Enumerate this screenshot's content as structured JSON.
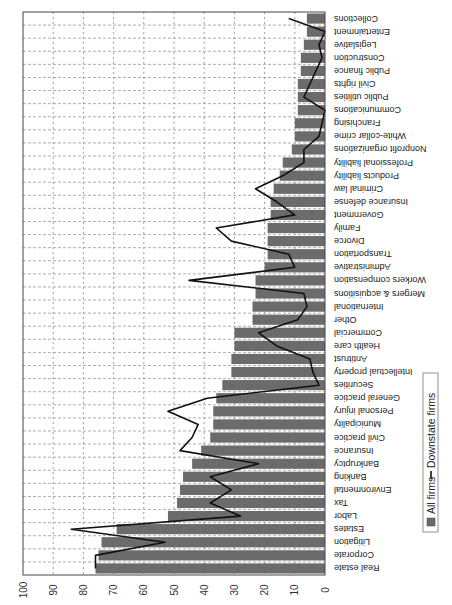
{
  "chart_data": {
    "type": "bar",
    "orientation_note": "Figure is rendered rotated: value axis runs right-to-left along the bottom, categories run top-to-bottom with upside-down labels.",
    "title": "",
    "xlabel": "",
    "ylabel": "",
    "ylim": [
      0,
      100
    ],
    "ticks": [
      0,
      10,
      20,
      30,
      40,
      50,
      60,
      70,
      80,
      90,
      100
    ],
    "grid": true,
    "legend_position": "right (rotated)",
    "categories": [
      "Real estate",
      "Corporate",
      "Litigation",
      "Estates",
      "Labor",
      "Tax",
      "Environmental",
      "Banking",
      "Bankruptcy",
      "Insurance",
      "Civil practice",
      "Municipality",
      "Personal injury",
      "General practice",
      "Securities",
      "Intellectual property",
      "Antitrust",
      "Health care",
      "Commercial",
      "Other",
      "International",
      "Mergers & acquisitions",
      "Workers compensation",
      "Administrative",
      "Transportation",
      "Divorce",
      "Family",
      "Government",
      "Insurance defense",
      "Criminal law",
      "Products liability",
      "Professional liability",
      "Nonprofit organizations",
      "White-collar crime",
      "Franchising",
      "Communications",
      "Public utilities",
      "Civil rights",
      "Public finance",
      "Construction",
      "Legislative",
      "Entertainment",
      "Collections"
    ],
    "series": [
      {
        "name": "All firms",
        "type": "bar",
        "color": "#6b6b6b",
        "values": [
          76,
          75,
          74,
          69,
          52,
          49,
          48,
          47,
          44,
          41,
          38,
          37,
          37,
          36,
          34,
          31,
          31,
          30,
          30,
          24,
          24,
          23,
          23,
          20,
          19,
          19,
          19,
          18,
          18,
          17,
          15,
          14,
          11,
          10,
          10,
          9,
          9,
          9,
          8,
          8,
          7,
          6,
          6
        ]
      },
      {
        "name": "Downstate firms",
        "type": "line",
        "color": "#111111",
        "values": [
          76,
          76,
          53,
          84,
          28,
          38,
          31,
          38,
          22,
          48,
          44,
          42,
          52,
          39,
          2,
          4,
          5,
          16,
          22,
          9,
          6,
          7,
          45,
          10,
          12,
          31,
          36,
          10,
          16,
          23,
          14,
          7,
          7,
          2,
          1,
          0,
          7,
          5,
          3,
          1,
          2,
          0,
          12
        ]
      }
    ]
  },
  "legend": {
    "items": [
      {
        "label": "All firms",
        "symbol": "bar-swatch"
      },
      {
        "label": "Downstate firms",
        "symbol": "line-swatch"
      }
    ]
  }
}
